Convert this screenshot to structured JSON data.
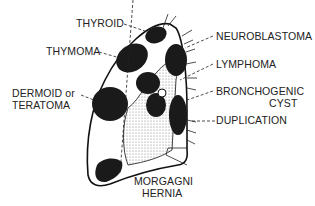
{
  "diagram": {
    "labels": {
      "thyroid": "THYROID",
      "thymoma": "THYMOMA",
      "dermoid_line1": "DERMOID or",
      "dermoid_line2": "TERATOMA",
      "neuroblastoma": "NEUROBLASTOMA",
      "lymphoma": "LYMPHOMA",
      "bronchogenic_line1": "BRONCHOGENIC",
      "bronchogenic_line2": "CYST",
      "duplication": "DUPLICATION",
      "morgagni_line1": "MORGAGNI",
      "morgagni_line2": "HERNIA"
    },
    "colors": {
      "mass": "#1a1a1a",
      "outline": "#111111",
      "stipple": "#888888",
      "text": "#222222"
    }
  }
}
